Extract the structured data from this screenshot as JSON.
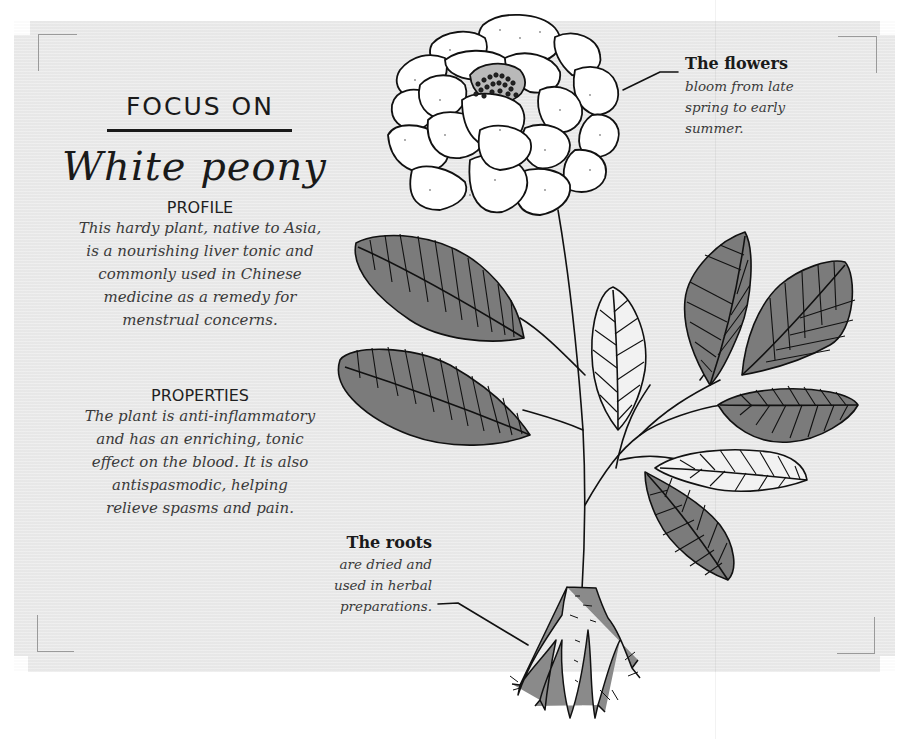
{
  "header": {
    "kicker": "FOCUS ON",
    "title": "White peony"
  },
  "profile": {
    "heading": "PROFILE",
    "lines": [
      "This hardy plant, native to Asia,",
      "is a nourishing liver tonic and",
      "commonly used in Chinese",
      "medicine as a remedy for",
      "menstrual concerns."
    ]
  },
  "properties": {
    "heading": "PROPERTIES",
    "lines": [
      "The plant is anti-inflammatory",
      "and has an enriching, tonic",
      "effect on the blood. It is also",
      "antispasmodic, helping",
      "relieve spasms and pain."
    ]
  },
  "callouts": {
    "flowers": {
      "title": "The flowers",
      "lines": [
        "bloom from late",
        "spring to early",
        "summer."
      ]
    },
    "roots": {
      "title": "The roots",
      "lines": [
        "are dried and",
        "used in herbal",
        "preparations."
      ]
    }
  },
  "illustration": {
    "subject": "white-peony-plant",
    "colors": {
      "paper": "#ebebeb",
      "leaf_fill": "#7b7b7b",
      "outline": "#111111",
      "petal_fill": "#ffffff",
      "root_fill": "#8a8a8a"
    }
  }
}
